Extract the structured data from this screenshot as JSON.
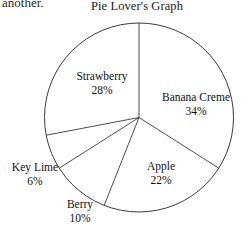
{
  "page": {
    "cut_off_text_above": "another.",
    "background_color": "#ffffff",
    "stroke_color": "#3a3a3a"
  },
  "chart_data": {
    "type": "pie",
    "title": "Pie Lover's Graph",
    "xlabel": "",
    "ylabel": "",
    "legend_position": "none",
    "labels_inline": true,
    "start_angle_deg": 0,
    "direction": "clockwise",
    "categories": [
      "Banana Creme",
      "Apple",
      "Berry",
      "Key Lime",
      "Strawberry"
    ],
    "values": [
      34,
      22,
      10,
      6,
      28
    ],
    "value_unit": "%",
    "total": 100,
    "slices": [
      {
        "name": "Banana Creme",
        "value": 34,
        "value_text": "34%",
        "label": "Banana Creme"
      },
      {
        "name": "Apple",
        "value": 22,
        "value_text": "22%",
        "label": "Apple"
      },
      {
        "name": "Berry",
        "value": 10,
        "value_text": "10%",
        "label": "Berry"
      },
      {
        "name": "Key Lime",
        "value": 6,
        "value_text": "6%",
        "label": "Key Lime"
      },
      {
        "name": "Strawberry",
        "value": 28,
        "value_text": "28%",
        "label": "Strawberry"
      }
    ]
  }
}
